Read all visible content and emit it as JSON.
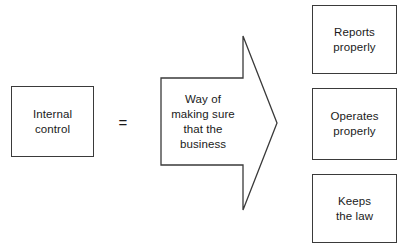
{
  "diagram": {
    "source_box": {
      "name": "internal-control",
      "label": "Internal\ncontrol"
    },
    "operator": {
      "name": "equals",
      "symbol": "="
    },
    "arrow": {
      "name": "definition-arrow",
      "label": "Way of\nmaking sure\nthat the\nbusiness",
      "direction": "right"
    },
    "outcomes": [
      {
        "label": "Reports\nproperly"
      },
      {
        "label": "Operates\nproperly"
      },
      {
        "label": "Keeps\nthe law"
      }
    ],
    "colors": {
      "stroke": "#3a3a3a",
      "text": "#1a1a1a",
      "background": "#ffffff"
    }
  }
}
